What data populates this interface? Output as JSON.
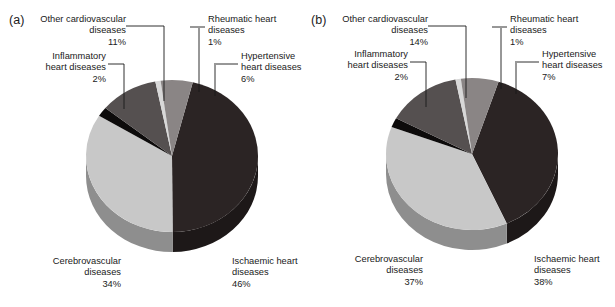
{
  "figure": {
    "background": "#ffffff",
    "text_color": "#1a1a1a"
  },
  "panels": [
    {
      "id": "a",
      "letter": "(a)",
      "labels": {
        "other": "Other cardiovascular\ndiseases\n11%",
        "rheumatic": "Rheumatic heart\ndiseases\n1%",
        "hypertensive": "Hypertensive\nheart diseases\n6%",
        "inflammatory": "Inflammatory\nheart diseases\n2%",
        "cerebrovascular": "Cerebrovascular\ndiseases\n34%",
        "ischaemic": "Ischaemic heart\ndiseases\n46%"
      }
    },
    {
      "id": "b",
      "letter": "(b)",
      "labels": {
        "other": "Other cardiovascular\ndiseases\n14%",
        "rheumatic": "Rheumatic heart\ndiseases\n1%",
        "hypertensive": "Hypertensive\nheart diseases\n7%",
        "inflammatory": "Inflammatory\nheart diseases\n2%",
        "cerebrovascular": "Cerebrovascular\ndiseases\n37%",
        "ischaemic": "Ischaemic heart\ndiseases\n38%"
      }
    }
  ],
  "chart_data": [
    {
      "type": "pie",
      "title": "(a)",
      "labels": [
        "Ischaemic heart diseases",
        "Cerebrovascular diseases",
        "Inflammatory heart diseases",
        "Other cardiovascular diseases",
        "Rheumatic heart diseases",
        "Hypertensive heart diseases"
      ],
      "values": [
        46,
        34,
        2,
        11,
        1,
        6
      ],
      "units": "%",
      "colors": [
        "#2b2424",
        "#c8c8c8",
        "#0d0b0b",
        "#555050",
        "#d8d8d8",
        "#8a8585"
      ],
      "legend": "none",
      "grid": false
    },
    {
      "type": "pie",
      "title": "(b)",
      "labels": [
        "Ischaemic heart diseases",
        "Cerebrovascular diseases",
        "Inflammatory heart diseases",
        "Other cardiovascular diseases",
        "Rheumatic heart diseases",
        "Hypertensive heart diseases"
      ],
      "values": [
        38,
        37,
        2,
        14,
        1,
        7
      ],
      "units": "%",
      "colors": [
        "#2b2424",
        "#c8c8c8",
        "#0d0b0b",
        "#555050",
        "#d8d8d8",
        "#8a8585"
      ],
      "legend": "none",
      "grid": false
    }
  ],
  "palette": {
    "ischaemic": "#2b2424",
    "cerebrovascular": "#c8c8c8",
    "inflammatory": "#0d0b0b",
    "other": "#555050",
    "rheumatic": "#d8d8d8",
    "hypertensive": "#8a8585",
    "side_dark": "#1d1818",
    "side_light": "#8e8e8e",
    "side_mid": "#3a3535",
    "side_black": "#070606",
    "side_hyper": "#5d5a5a"
  }
}
